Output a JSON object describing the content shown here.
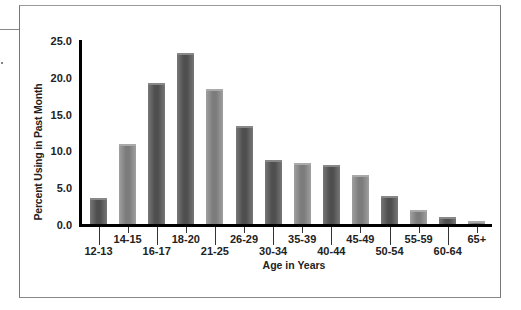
{
  "chart_data": {
    "type": "bar",
    "title": "",
    "xlabel": "Age in Years",
    "ylabel": "Percent Using in Past Month",
    "ylim": [
      0,
      25
    ],
    "yticks": [
      "0.0",
      "5.0",
      "10.0",
      "15.0",
      "20.0",
      "25.0"
    ],
    "grid": false,
    "legend": null,
    "categories": [
      "12-13",
      "14-15",
      "16-17",
      "18-20",
      "21-25",
      "26-29",
      "30-34",
      "35-39",
      "40-44",
      "45-49",
      "50-54",
      "55-59",
      "60-64",
      "65+"
    ],
    "values": [
      3.7,
      11.0,
      19.3,
      23.4,
      18.5,
      13.4,
      8.8,
      8.4,
      8.2,
      6.8,
      3.9,
      2.0,
      1.1,
      0.6
    ],
    "bar_shades": [
      "dark",
      "light",
      "dark",
      "dark",
      "light",
      "dark",
      "dark",
      "light",
      "dark",
      "light",
      "dark",
      "light",
      "dark",
      "light"
    ]
  }
}
